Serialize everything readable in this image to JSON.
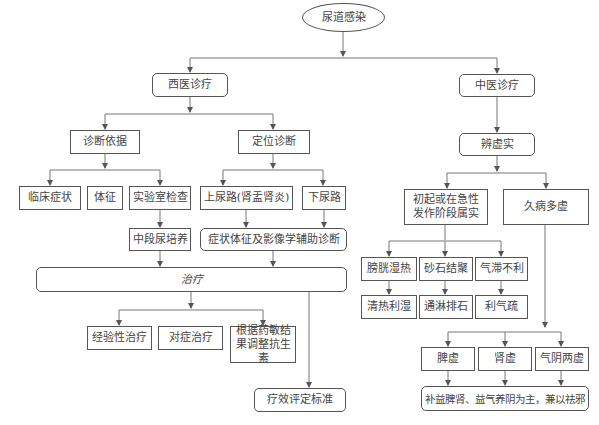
{
  "diagram": {
    "root": "尿道感染",
    "western": {
      "title": "西医诊疗",
      "diagnosis_basis": {
        "title": "诊断依据",
        "items": [
          "临床症状",
          "体征",
          "实验室检查"
        ],
        "lab_sub": "中段尿培养"
      },
      "localization": {
        "title": "定位诊断",
        "items": [
          "上尿路(肾盂肾炎)",
          "下尿路"
        ],
        "sub": "症状体征及影像学辅助诊断"
      },
      "treatment": {
        "title": "治疗",
        "items": [
          "经验性治疗",
          "对症治疗",
          "根据药敏结果调整抗生素"
        ],
        "evaluation": "疗效评定标准"
      }
    },
    "tcm": {
      "title": "中医诊疗",
      "differentiation": "辨虚实",
      "excess": {
        "title": "初起或在急性发作阶段属实",
        "patterns": [
          "膀胱湿热",
          "砂石结聚",
          "气滞不利"
        ],
        "treatments": [
          "清热利湿",
          "通淋排石",
          "利气疏"
        ]
      },
      "deficiency": {
        "title": "久病多虚",
        "patterns": [
          "脾虚",
          "肾虚",
          "气阴两虚"
        ],
        "treatment": "补益脾肾、益气养阴为主，兼以祛邪"
      }
    }
  }
}
